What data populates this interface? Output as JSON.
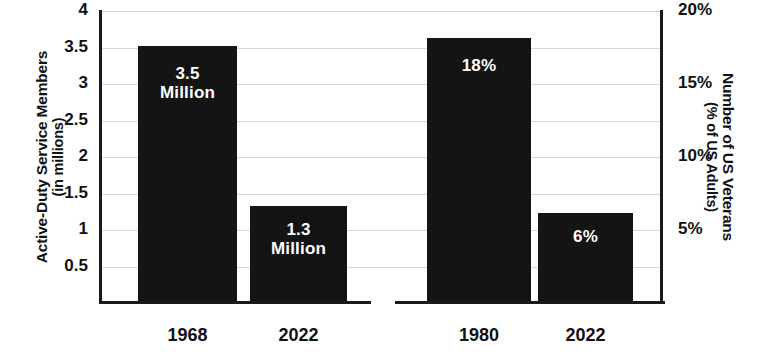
{
  "chart_data": [
    {
      "type": "bar",
      "id": "active-duty-service-members",
      "title": "",
      "xlabel": "",
      "ylabel": "Active-Duty Service Members",
      "ylabel_sub": "(in millions)",
      "categories": [
        "1968",
        "2022"
      ],
      "values": [
        3.5,
        1.3
      ],
      "value_labels": [
        [
          "3.5",
          "Million"
        ],
        [
          "1.3",
          "Million"
        ]
      ],
      "ylim": [
        0,
        4
      ],
      "yticks": [
        4,
        3.5,
        3,
        2.5,
        2,
        1.5,
        1,
        0.5
      ],
      "ytick_labels": [
        "4",
        "3.5",
        "3",
        "2.5",
        "2",
        "1.5",
        "1",
        "0.5"
      ],
      "axis_side": "left",
      "grid": true,
      "legend": "none",
      "bar_color": "#141414",
      "grid_color": "#d9d9d9",
      "text_color": "#111111",
      "label_color": "#ffffff"
    },
    {
      "type": "bar",
      "id": "us-veterans-percent",
      "title": "",
      "xlabel": "",
      "ylabel": "Number of US Veterans",
      "ylabel_sub": "(% of US Adults)",
      "categories": [
        "1980",
        "2022"
      ],
      "values": [
        18,
        6
      ],
      "value_labels": [
        [
          "18%"
        ],
        [
          "6%"
        ]
      ],
      "ylim": [
        0,
        20
      ],
      "yticks": [
        20,
        15,
        10,
        5
      ],
      "ytick_labels": [
        "20%",
        "15%",
        "10%",
        "5%"
      ],
      "axis_side": "right",
      "grid": true,
      "legend": "none",
      "bar_color": "#141414",
      "grid_color": "#d9d9d9",
      "text_color": "#111111",
      "label_color": "#ffffff"
    }
  ],
  "left_chart": {
    "axis_title_main": "Active-Duty Service Members",
    "axis_title_sub": "(in millions)",
    "ticks": [
      "4",
      "3.5",
      "3",
      "2.5",
      "2",
      "1.5",
      "1",
      "0.5"
    ],
    "bars": [
      {
        "category": "1968",
        "value": "3.5",
        "label_line1": "3.5",
        "label_line2": "Million"
      },
      {
        "category": "2022",
        "value": "1.3",
        "label_line1": "1.3",
        "label_line2": "Million"
      }
    ]
  },
  "right_chart": {
    "axis_title_main": "Number of US Veterans",
    "axis_title_sub": "(% of US Adults)",
    "ticks": [
      "20%",
      "15%",
      "10%",
      "5%"
    ],
    "bars": [
      {
        "category": "1980",
        "value": "18%",
        "label_line1": "18%",
        "label_line2": ""
      },
      {
        "category": "2022",
        "value": "6%",
        "label_line1": "6%",
        "label_line2": ""
      }
    ]
  }
}
